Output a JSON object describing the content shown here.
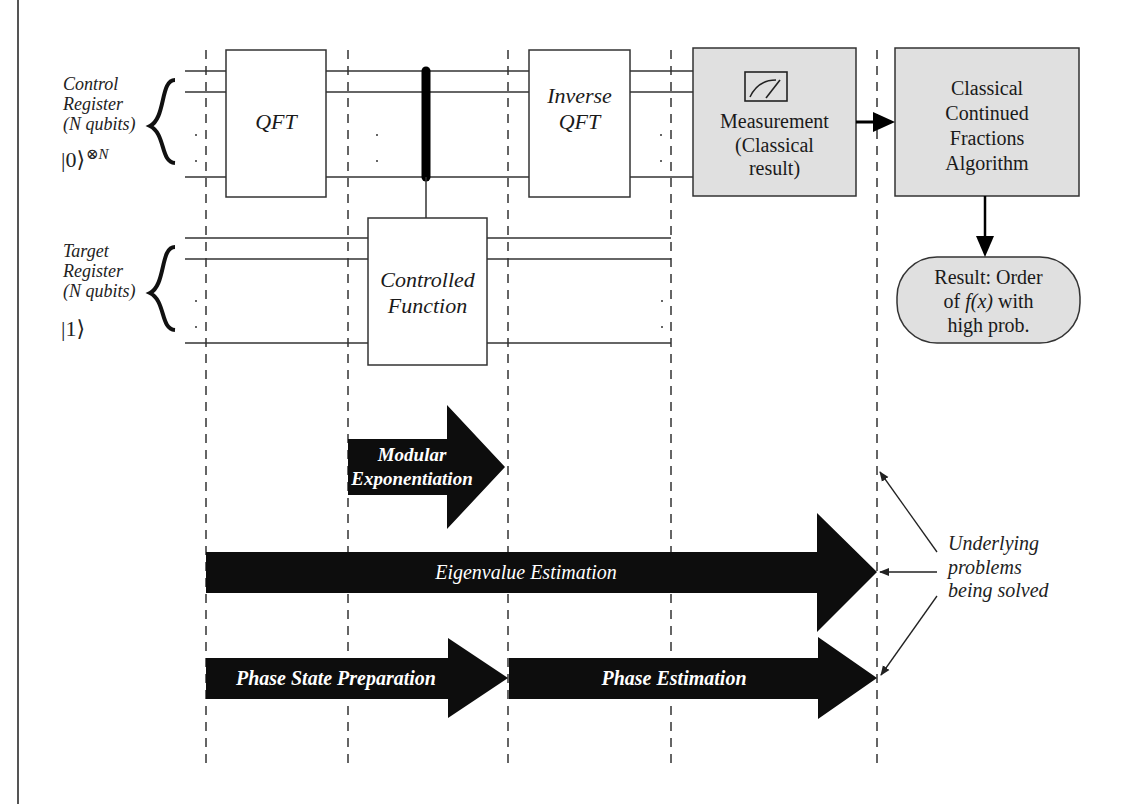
{
  "diagram": {
    "control_register": {
      "label_lines": [
        "Control",
        "Register",
        "(N qubits)"
      ],
      "initial_state": "|0⟩",
      "initial_state_exp": "⊗N"
    },
    "target_register": {
      "label_lines": [
        "Target",
        "Register",
        "(N qubits)"
      ],
      "initial_state": "|1⟩"
    },
    "gates": {
      "qft": "QFT",
      "controlled_function_lines": [
        "Controlled",
        "Function"
      ],
      "inverse_qft_lines": [
        "Inverse",
        "QFT"
      ]
    },
    "classical_boxes": {
      "measurement_lines": [
        "Measurement",
        "(Classical",
        "result)"
      ],
      "measurement_icon": "meter-icon",
      "continued_fractions_lines": [
        "Classical",
        "Continued",
        "Fractions",
        "Algorithm"
      ],
      "result_line1": "Result: Order",
      "result_line2_pre": "of ",
      "result_line2_fx": "f(x)",
      "result_line2_post": " with",
      "result_line3": "high prob."
    },
    "stage_arrows": {
      "modular_exponentiation_lines": [
        "Modular",
        "Exponentiation"
      ],
      "eigenvalue_estimation": "Eigenvalue Estimation",
      "phase_state_preparation": "Phase State Preparation",
      "phase_estimation": "Phase Estimation"
    },
    "annotation": {
      "lines": [
        "Underlying",
        "problems",
        "being solved"
      ]
    },
    "colors": {
      "box_fill": "#e0e0e0",
      "arrow_fill": "#0d0d0d",
      "line": "#333333"
    }
  }
}
